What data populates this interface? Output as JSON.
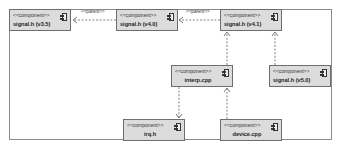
{
  "diagram": {
    "type": "uml-component",
    "stereotype": "<<component>>",
    "components": [
      {
        "id": "v35",
        "name": "signal.h (v3.5)"
      },
      {
        "id": "v40",
        "name": "signal.h (v4.0)"
      },
      {
        "id": "v41",
        "name": "signal.h (v4.1)"
      },
      {
        "id": "interp",
        "name": "interp.cpp"
      },
      {
        "id": "v50",
        "name": "signal.h (v5.0)"
      },
      {
        "id": "irq",
        "name": "irq.h"
      },
      {
        "id": "device",
        "name": "device.cpp"
      }
    ],
    "edges": [
      {
        "from": "signal.h (v4.0)",
        "to": "signal.h (v3.5)",
        "label": "<<parent>>",
        "style": "dashed"
      },
      {
        "from": "signal.h (v4.1)",
        "to": "signal.h (v4.0)",
        "label": "<<parent>>",
        "style": "dashed"
      },
      {
        "from": "interp.cpp",
        "to": "signal.h (v4.1)",
        "label": "",
        "style": "dashed"
      },
      {
        "from": "signal.h (v5.0)",
        "to": "signal.h (v4.1)",
        "label": "",
        "style": "dashed"
      },
      {
        "from": "interp.cpp",
        "to": "irq.h",
        "label": "",
        "style": "dashed"
      },
      {
        "from": "device.cpp",
        "to": "interp.cpp",
        "label": "",
        "style": "dashed"
      }
    ],
    "edge_labels": {
      "parent_1": "<<parent>>",
      "parent_2": "<<parent>>"
    },
    "colors": {
      "box_fill": "#dcdcdc",
      "box_border": "#6e6e6e",
      "line": "#666666",
      "frame": "#8a8a8a"
    }
  }
}
